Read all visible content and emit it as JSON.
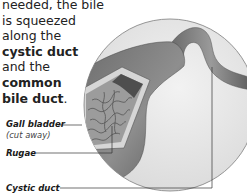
{
  "intro": {
    "line1": "needed, the bile",
    "line2": "is squeezed",
    "line3": "along the",
    "bold1": "cystic duct",
    "line4": "and the",
    "bold2a": "common",
    "bold2b": "bile duct",
    "end": "."
  },
  "labels": {
    "gall_bladder": "Gall bladder",
    "gall_bladder_note": "(cut away)",
    "rugae": "Rugae",
    "cystic_duct": "Cystic duct"
  },
  "colors": {
    "circle_bg": "#eaeaea",
    "circle_stroke": "#8a8a8a",
    "organ_dark": "#5a5a5a",
    "organ_mid": "#8c8c8c",
    "leader_line": "#333333"
  }
}
